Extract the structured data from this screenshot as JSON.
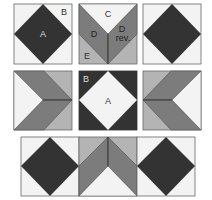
{
  "colors": {
    "background": "#f3f3f3",
    "light": "#b4b4b4",
    "mid": "#7c7c7c",
    "dark": "#333333",
    "outline": "#555555"
  },
  "labels": {
    "row1_block1_A": "A",
    "row1_block1_B": "B",
    "row1_block2_C": "C",
    "row1_block2_D": "D",
    "row1_block2_Drev_1": "D",
    "row1_block2_Drev_2": "rev.",
    "row1_block2_E": "E",
    "row2_block2_B": "B",
    "row2_block2_A": "A"
  },
  "blocks": [
    {
      "row": 1,
      "col": 1,
      "type": "square-in-square",
      "variant": "dark-diamond"
    },
    {
      "row": 1,
      "col": 2,
      "type": "chevron",
      "orientation": "point-down"
    },
    {
      "row": 1,
      "col": 3,
      "type": "square-in-square",
      "variant": "dark-diamond"
    },
    {
      "row": 2,
      "col": 1,
      "type": "chevron",
      "orientation": "point-right"
    },
    {
      "row": 2,
      "col": 2,
      "type": "square-in-square",
      "variant": "light-diamond"
    },
    {
      "row": 2,
      "col": 3,
      "type": "chevron",
      "orientation": "point-left"
    },
    {
      "row": 3,
      "col": 1,
      "type": "square-in-square",
      "variant": "dark-diamond"
    },
    {
      "row": 3,
      "col": 2,
      "type": "chevron",
      "orientation": "point-up"
    },
    {
      "row": 3,
      "col": 3,
      "type": "square-in-square",
      "variant": "dark-diamond"
    }
  ]
}
